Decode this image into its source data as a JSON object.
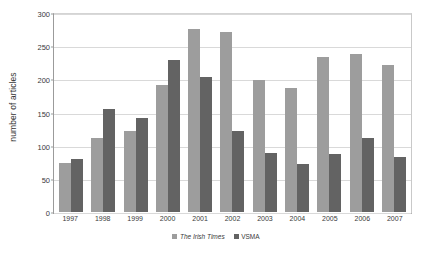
{
  "chart_data": {
    "type": "bar",
    "title": "",
    "xlabel": "",
    "ylabel": "number of articles",
    "ylim": [
      0,
      300
    ],
    "ytick_values": [
      0,
      50,
      100,
      150,
      200,
      250,
      300
    ],
    "ytick_labels": [
      "0",
      "50",
      "100",
      "150",
      "200",
      "250",
      "300"
    ],
    "grid": true,
    "legend_position": "bottom-center",
    "categories": [
      "1997",
      "1998",
      "1999",
      "2000",
      "2001",
      "2002",
      "2003",
      "2004",
      "2005",
      "2006",
      "2007"
    ],
    "series": [
      {
        "name": "The Irish Times",
        "color": "#9d9d9d",
        "italic": true,
        "values": [
          75,
          112,
          122,
          193,
          278,
          272,
          200,
          188,
          235,
          240,
          223
        ]
      },
      {
        "name": "VSMA",
        "color": "#636363",
        "italic": false,
        "values": [
          80,
          156,
          143,
          231,
          205,
          122,
          90,
          72,
          88,
          112,
          83
        ]
      }
    ]
  }
}
